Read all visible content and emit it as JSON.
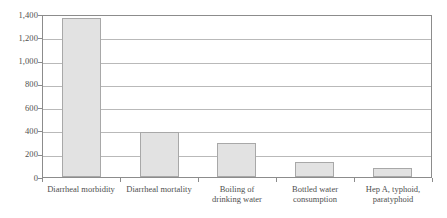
{
  "chart_data": {
    "type": "bar",
    "title": "",
    "subtitle": "",
    "xlabel": "",
    "ylabel": "",
    "ylim": [
      0,
      1400
    ],
    "grid": true,
    "legend": false,
    "legend_position": "none",
    "categories": [
      "Diarrheal morbidity",
      "Diarrheal mortality",
      "Boiling of drinking water",
      "Bottled water consumption",
      "Hep A, typhoid, paratyphoid"
    ],
    "category_lines": [
      [
        "Diarrheal morbidity",
        ""
      ],
      [
        "Diarrheal mortality",
        ""
      ],
      [
        "Boiling of",
        "drinking water"
      ],
      [
        "Bottled water",
        "consumption"
      ],
      [
        "Hep A, typhoid,",
        "paratyphoid"
      ]
    ],
    "values": [
      1370,
      390,
      290,
      130,
      80
    ],
    "ytick_values": [
      0,
      200,
      400,
      600,
      800,
      1000,
      1200,
      1400
    ],
    "ytick_labels": [
      "0",
      "200",
      "400",
      "600",
      "800",
      "1,000",
      "1,200",
      "1,400"
    ],
    "colors": {
      "bar_fill": "#e2e2e2",
      "bar_border": "#a8a8a8",
      "gridline": "#b9b9b9",
      "axis": "#8c8c8c",
      "text": "#4f4f4f",
      "background": "#ffffff"
    }
  }
}
